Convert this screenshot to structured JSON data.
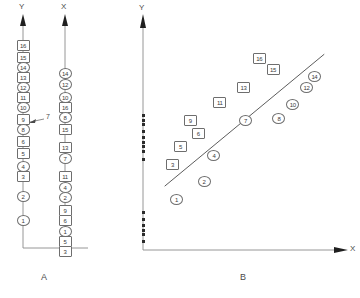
{
  "figure": {
    "panel_a": {
      "caption": "A",
      "axes": [
        {
          "name": "y-axis",
          "label": "Y"
        },
        {
          "name": "x-axis",
          "label": "X"
        }
      ],
      "annotation": "7",
      "y_column": {
        "axis_label": "Y",
        "markers": [
          {
            "label": "16",
            "shape": "square"
          },
          {
            "label": "15",
            "shape": "square"
          },
          {
            "label": "14",
            "shape": "circle"
          },
          {
            "label": "13",
            "shape": "square"
          },
          {
            "label": "12",
            "shape": "circle"
          },
          {
            "label": "11",
            "shape": "square"
          },
          {
            "label": "10",
            "shape": "circle"
          },
          {
            "label": "9",
            "shape": "square"
          },
          {
            "label": "8",
            "shape": "circle"
          },
          {
            "label": "6",
            "shape": "square"
          },
          {
            "label": "5",
            "shape": "square"
          },
          {
            "label": "4",
            "shape": "circle"
          },
          {
            "label": "3",
            "shape": "square"
          },
          {
            "label": "2",
            "shape": "circle"
          },
          {
            "label": "1",
            "shape": "circle"
          }
        ]
      },
      "x_column": {
        "axis_label": "X",
        "markers": [
          {
            "label": "14",
            "shape": "circle"
          },
          {
            "label": "12",
            "shape": "circle"
          },
          {
            "label": "10",
            "shape": "circle"
          },
          {
            "label": "16",
            "shape": "square"
          },
          {
            "label": "8",
            "shape": "circle"
          },
          {
            "label": "15",
            "shape": "square"
          },
          {
            "label": "13",
            "shape": "square"
          },
          {
            "label": "7",
            "shape": "circle"
          },
          {
            "label": "11",
            "shape": "square"
          },
          {
            "label": "4",
            "shape": "circle"
          },
          {
            "label": "2",
            "shape": "circle"
          },
          {
            "label": "9",
            "shape": "square"
          },
          {
            "label": "6",
            "shape": "square"
          },
          {
            "label": "1",
            "shape": "circle"
          },
          {
            "label": "5",
            "shape": "square"
          },
          {
            "label": "3",
            "shape": "square"
          }
        ]
      }
    },
    "panel_b": {
      "caption": "B",
      "x_axis_label": "X",
      "y_axis_label": "Y"
    }
  },
  "chart_data": {
    "type": "scatter",
    "title": "",
    "subtitle": "",
    "xlabel": "X",
    "ylabel": "Y",
    "xlim": [
      0,
      100
    ],
    "ylim": [
      0,
      100
    ],
    "grid": false,
    "legend": null,
    "annotations": [
      "A",
      "B",
      "7"
    ],
    "series": [
      {
        "name": "circle-ranks",
        "marker": "circle",
        "points": [
          {
            "label": "1",
            "x": 17,
            "y": 23
          },
          {
            "label": "2",
            "x": 31,
            "y": 31
          },
          {
            "label": "4",
            "x": 36,
            "y": 43
          },
          {
            "label": "7",
            "x": 52,
            "y": 59
          },
          {
            "label": "8",
            "x": 69,
            "y": 60
          },
          {
            "label": "10",
            "x": 76,
            "y": 66
          },
          {
            "label": "12",
            "x": 83,
            "y": 74
          },
          {
            "label": "14",
            "x": 87,
            "y": 79
          }
        ]
      },
      {
        "name": "square-ranks",
        "marker": "square",
        "points": [
          {
            "label": "3",
            "x": 15,
            "y": 39
          },
          {
            "label": "5",
            "x": 19,
            "y": 47
          },
          {
            "label": "6",
            "x": 28,
            "y": 53
          },
          {
            "label": "9",
            "x": 24,
            "y": 59
          },
          {
            "label": "11",
            "x": 39,
            "y": 67
          },
          {
            "label": "13",
            "x": 51,
            "y": 74
          },
          {
            "label": "15",
            "x": 66,
            "y": 82
          },
          {
            "label": "16",
            "x": 59,
            "y": 87
          }
        ]
      }
    ],
    "fit_line": {
      "name": "regression-line",
      "x0": 11,
      "y0": 29,
      "x1": 92,
      "y1": 89
    },
    "rug_y": [
      41,
      45,
      47,
      49,
      51,
      54,
      57,
      59,
      61,
      17,
      14,
      11,
      9,
      7,
      4
    ]
  }
}
